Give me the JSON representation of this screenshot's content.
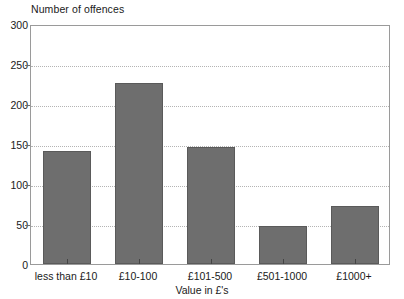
{
  "chart_data": {
    "type": "bar",
    "title": "Number of offences",
    "xlabel": "Value in £'s",
    "ylabel": "Number of offences",
    "categories": [
      "less than £10",
      "£10-100",
      "£101-500",
      "£501-1000",
      "£1000+"
    ],
    "values": [
      141,
      226,
      146,
      48,
      72
    ],
    "ylim": [
      0,
      300
    ],
    "yticks": [
      0,
      50,
      100,
      150,
      200,
      250,
      300
    ],
    "ytick_labels": [
      "0",
      "50",
      "100",
      "150",
      "200",
      "250",
      "300"
    ],
    "grid": true,
    "legend": false,
    "legend_position": "none",
    "bar_color": "#6e6e6e",
    "bar_border_color": "#5a5a5a",
    "gridline_color": "#b4b4b4",
    "frame_color": "#9a9a9a",
    "background_color": "#ffffff"
  }
}
